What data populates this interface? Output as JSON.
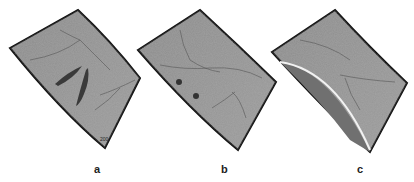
{
  "figure": {
    "panels": [
      {
        "label": "a",
        "features": [
          "curved retinal sheet",
          "elongated dark slits",
          "scale mark"
        ],
        "scale_text": "200"
      },
      {
        "label": "b",
        "features": [
          "curved retinal sheet",
          "two dark dots"
        ]
      },
      {
        "label": "c",
        "features": [
          "curved retinal sheet",
          "curved fold with bright edge"
        ]
      }
    ]
  }
}
